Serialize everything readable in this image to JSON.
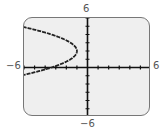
{
  "chart_data": {
    "type": "line",
    "title": "",
    "xlabel": "",
    "ylabel": "",
    "xlim": [
      -6,
      6
    ],
    "ylim": [
      -6,
      6
    ],
    "tick_labels": {
      "x_min": "−6",
      "x_max": "6",
      "y_min": "−6",
      "y_max": "6"
    },
    "x_ticks_step": 1,
    "y_ticks_step": 1,
    "grid": false,
    "series": [
      {
        "name": "sideways parabola opening left",
        "equation": "x = -1 - 0.6(y - 2)^2",
        "vertex": [
          -1,
          2
        ],
        "points": [
          [
            -6,
            4.9
          ],
          [
            -4,
            4.2
          ],
          [
            -2,
            3.3
          ],
          [
            -1,
            2
          ],
          [
            -2,
            0.7
          ],
          [
            -4,
            -0.2
          ],
          [
            -6,
            -0.9
          ]
        ]
      }
    ]
  },
  "labels": {
    "x_min": "−6",
    "x_max": "6",
    "y_min": "−6",
    "y_max": "6"
  },
  "colors": {
    "screen_bg": "#efefef",
    "frame": "#777777",
    "curve": "#222222",
    "axis": "#111111"
  }
}
